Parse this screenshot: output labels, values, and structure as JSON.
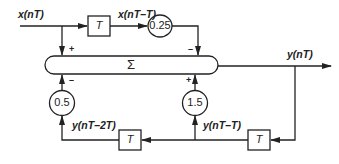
{
  "diagram": {
    "type": "signal-flow / digital filter block diagram",
    "summer": {
      "symbol": "Σ"
    },
    "signals": {
      "input": "x(nT)",
      "input_delayed": "x(nT–T)",
      "output": "y(nT)",
      "output_delayed_1": "y(nT–T)",
      "output_delayed_2": "y(nT–2T)"
    },
    "delays": [
      {
        "id": "delay-input",
        "label": "T"
      },
      {
        "id": "delay-output-1",
        "label": "T"
      },
      {
        "id": "delay-output-2",
        "label": "T"
      }
    ],
    "gains": [
      {
        "id": "gain-input-delayed",
        "value": "0.25"
      },
      {
        "id": "gain-output-1",
        "value": "1.5"
      },
      {
        "id": "gain-output-2",
        "value": "0.5"
      }
    ],
    "signs": {
      "input": "+",
      "input_delayed": "–",
      "output_delayed_2": "–",
      "output_delayed_1": "+"
    }
  }
}
